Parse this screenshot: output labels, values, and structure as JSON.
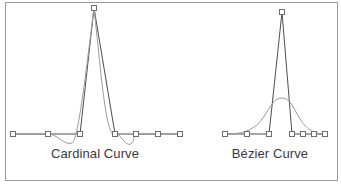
{
  "figure": {
    "background_color": "#ffffff",
    "frame_border_color": "#9a9a9a",
    "polyline_color": "#4d4d4d",
    "curve_color": "#9b9b9b",
    "marker_fill": "#ffffff",
    "marker_stroke": "#6e6e6e",
    "baseline_y": 134
  },
  "panels": [
    {
      "id": "cardinal",
      "label": "Cardinal Curve",
      "label_color": "#3a3a3a",
      "control_points": [
        {
          "x": 13,
          "y": 134
        },
        {
          "x": 48,
          "y": 134
        },
        {
          "x": 80,
          "y": 134
        },
        {
          "x": 94,
          "y": 8
        },
        {
          "x": 115,
          "y": 134
        },
        {
          "x": 136,
          "y": 134
        },
        {
          "x": 158,
          "y": 134
        },
        {
          "x": 180,
          "y": 134
        }
      ],
      "control_polygon": "M13,134 L48,134 L80,134 L94,8 L115,134 L136,134 L158,134 L180,134",
      "interpolated_curve": "M13,134 C24,134 36,134 48,134 C58,134 64,146 72,143 C78,140 85,80 94,8 C101,72 106,140 115,134 C120,131 124,147 131,144 C134,142 134,134 136,134 C143,134 151,134 158,134 C165,134 173,134 180,134"
    },
    {
      "id": "bezier",
      "label": "Bézier Curve",
      "label_color": "#3a3a3a",
      "control_points": [
        {
          "x": 225,
          "y": 134
        },
        {
          "x": 247,
          "y": 134
        },
        {
          "x": 269,
          "y": 134
        },
        {
          "x": 282,
          "y": 12
        },
        {
          "x": 292,
          "y": 134
        },
        {
          "x": 303,
          "y": 134
        },
        {
          "x": 314,
          "y": 134
        },
        {
          "x": 325,
          "y": 134
        }
      ],
      "control_polygon": "M225,134 L247,134 L269,134 L282,12 L292,134 L303,134 L314,134 L325,134",
      "interpolated_curve": "M225,134 C240,134 253,132 263,118 C271,106 274,98 282,98 C290,98 293,107 300,119 C309,133 318,134 325,134"
    }
  ]
}
